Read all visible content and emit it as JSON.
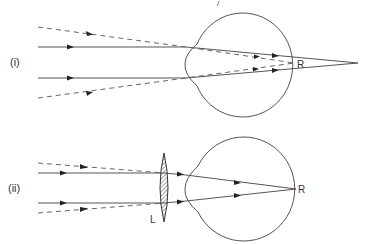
{
  "figure": {
    "top_artifact_mark": "/",
    "panels": [
      {
        "id": "i",
        "label": "(i)",
        "retina_point_label": "R",
        "note": "Parallel rays (solid) focus beyond the retina; dashed rays from near point converge at R"
      },
      {
        "id": "ii",
        "label": "(ii)",
        "retina_point_label": "R",
        "lens_label": "L",
        "note": "Converging lens L placed before the eye brings parallel rays to focus at R"
      }
    ]
  },
  "colors": {
    "line": "#555555",
    "dashed": "#666666",
    "arrowhead": "#222222",
    "text": "#333333",
    "background": "#ffffff"
  }
}
